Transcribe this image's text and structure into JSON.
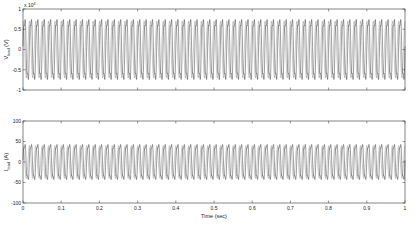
{
  "chart_data": [
    {
      "type": "line",
      "title": "",
      "xlabel": "",
      "ylabel": "V",
      "ylabel_sub": "load",
      "ylabel_unit": " (V)",
      "y_exponent_label": "x 10",
      "y_exponent": "4",
      "xlim": [
        0,
        1
      ],
      "ylim": [
        -1,
        1
      ],
      "xticks": [
        0,
        0.1,
        0.2,
        0.3,
        0.4,
        0.5,
        0.6,
        0.7,
        0.8,
        0.9,
        1
      ],
      "yticks": [
        -1,
        -0.5,
        0,
        0.5,
        1
      ],
      "ytick_labels": [
        "-1",
        "-0.5",
        "0",
        "0.5",
        "1"
      ],
      "series": [
        {
          "name": "Vload",
          "waveform": "sinusoid",
          "frequency_hz": 60,
          "amplitude": 0.9,
          "inner_amplitude": 0.7,
          "color": "#000000"
        }
      ],
      "grid": false
    },
    {
      "type": "line",
      "title": "",
      "xlabel": "Time (sec)",
      "ylabel": "I",
      "ylabel_sub": "load",
      "ylabel_unit": " (A)",
      "xlim": [
        0,
        1
      ],
      "ylim": [
        -100,
        100
      ],
      "xticks": [
        0,
        0.1,
        0.2,
        0.3,
        0.4,
        0.5,
        0.6,
        0.7,
        0.8,
        0.9,
        1
      ],
      "xtick_labels": [
        "0",
        "0.1",
        "0.2",
        "0.3",
        "0.4",
        "0.5",
        "0.6",
        "0.7",
        "0.8",
        "0.9",
        "1"
      ],
      "yticks": [
        -100,
        -50,
        0,
        50,
        100
      ],
      "ytick_labels": [
        "-100",
        "-50",
        "0",
        "50",
        "100"
      ],
      "series": [
        {
          "name": "Iload",
          "waveform": "sinusoid",
          "frequency_hz": 60,
          "amplitude": 52,
          "inner_amplitude": 40,
          "color": "#000000"
        }
      ],
      "grid": false
    }
  ]
}
